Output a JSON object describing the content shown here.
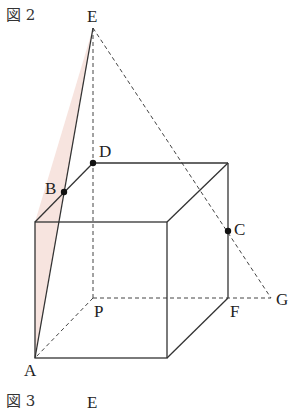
{
  "figure2": {
    "title": "図 2",
    "points": {
      "E": {
        "label": "E",
        "x": 93,
        "y": 28
      },
      "D": {
        "label": "D",
        "x": 93,
        "y": 163
      },
      "B": {
        "label": "B",
        "x": 64,
        "y": 192
      },
      "C": {
        "label": "C",
        "x": 228,
        "y": 231
      },
      "G": {
        "label": "G",
        "x": 271,
        "y": 298
      },
      "F": {
        "label": "F",
        "x": 228,
        "y": 298
      },
      "P": {
        "label": "P",
        "x": 93,
        "y": 298
      },
      "A": {
        "label": "A",
        "x": 35,
        "y": 358
      }
    },
    "shaded_color": "#f7e4df",
    "line_color": "#333333"
  },
  "figure3": {
    "title": "図 3",
    "label_E": "E"
  }
}
